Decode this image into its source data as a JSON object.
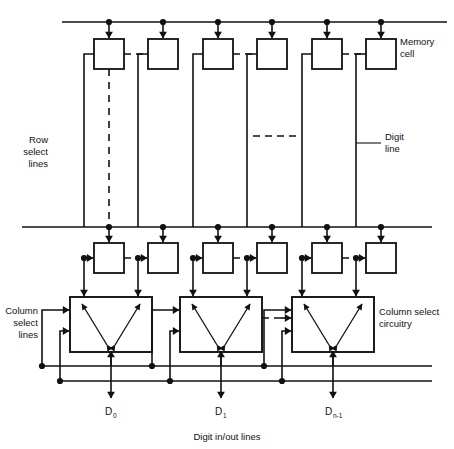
{
  "diagram": {
    "caption": "Digit in/out lines",
    "labels": {
      "memory_cell": "Memory",
      "memory_cell_2": "cell",
      "row_select": "Row",
      "row_select_2": "select",
      "row_select_3": "lines",
      "digit_line": "Digit",
      "digit_line_2": "line",
      "column_select_lines": "Column",
      "column_select_lines_2": "select",
      "column_select_lines_3": "lines",
      "column_select_circuitry": "Column select",
      "column_select_circuitry_2": "circuitry"
    },
    "outputs": [
      {
        "base": "D",
        "sub": "0"
      },
      {
        "base": "D",
        "sub": "1"
      },
      {
        "base": "D",
        "sub": "n-1"
      }
    ],
    "rows": [
      {
        "name": "row-select-line-0",
        "y": 22,
        "cells": 6
      },
      {
        "name": "row-select-line-1",
        "y": 227,
        "cells": 6
      }
    ],
    "memory_cells": {
      "count_per_row": 6,
      "x_positions": [
        109,
        163,
        218,
        272,
        327,
        381
      ],
      "row_y": [
        39,
        243
      ],
      "size": 30
    },
    "digit_lines": {
      "count": 6,
      "x_positions": [
        84,
        138,
        193,
        247,
        302,
        356
      ]
    },
    "column_select_boxes": {
      "count": 3,
      "x_positions": [
        70,
        180,
        292
      ],
      "y": 297,
      "width": 82,
      "height": 55
    },
    "column_select_lines": {
      "count": 2,
      "y_positions": [
        366,
        381
      ]
    },
    "colors": {
      "ink": "#111111",
      "background": "#ffffff"
    }
  }
}
